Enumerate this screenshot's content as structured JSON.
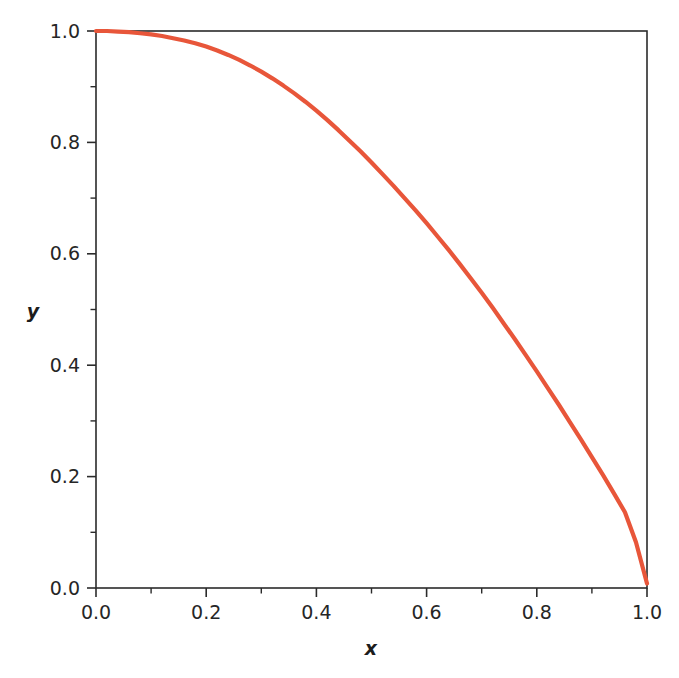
{
  "figure": {
    "background_color": "#ffffff",
    "frame_color": "#2b2b2b",
    "width": 679,
    "height": 678
  },
  "axes": {
    "x_title": "x",
    "y_title": "y",
    "x_tick_labels": [
      "0.0",
      "0.2",
      "0.4",
      "0.6",
      "0.8",
      "1.0"
    ],
    "y_tick_labels": [
      "0.0",
      "0.2",
      "0.4",
      "0.6",
      "0.8",
      "1.0"
    ]
  },
  "chart_data": {
    "type": "line",
    "title": "",
    "subtitle": "",
    "xlabel": "x",
    "ylabel": "y",
    "xlim": [
      0.0,
      1.0
    ],
    "ylim": [
      0.0,
      1.0
    ],
    "xticks": [
      0.0,
      0.2,
      0.4,
      0.6,
      0.8,
      1.0
    ],
    "yticks": [
      0.0,
      0.2,
      0.4,
      0.6,
      0.8,
      1.0
    ],
    "xtick_labels": [
      "0.0",
      "0.2",
      "0.4",
      "0.6",
      "0.8",
      "1.0"
    ],
    "ytick_labels": [
      "0.0",
      "0.2",
      "0.4",
      "0.6",
      "0.8",
      "1.0"
    ],
    "x_minor_tick_interval": 0.1,
    "y_minor_tick_interval": 0.1,
    "grid": false,
    "legend": null,
    "legend_position": "none",
    "annotations": [],
    "series": [
      {
        "name": "y(x)",
        "color": "#E8563A",
        "line_width": 4.2,
        "x": [
          0.0,
          0.02,
          0.04,
          0.06,
          0.08,
          0.1,
          0.12,
          0.14,
          0.16,
          0.18,
          0.2,
          0.22,
          0.24,
          0.26,
          0.28,
          0.3,
          0.32,
          0.34,
          0.36,
          0.38,
          0.4,
          0.42,
          0.44,
          0.46,
          0.48,
          0.5,
          0.52,
          0.54,
          0.56,
          0.58,
          0.6,
          0.62,
          0.64,
          0.66,
          0.68,
          0.7,
          0.72,
          0.74,
          0.76,
          0.78,
          0.8,
          0.82,
          0.84,
          0.86,
          0.88,
          0.9,
          0.92,
          0.94,
          0.96,
          0.98,
          1.0
        ],
        "y": [
          1.0,
          1.0,
          0.999,
          0.998,
          0.996,
          0.994,
          0.991,
          0.987,
          0.983,
          0.978,
          0.972,
          0.965,
          0.957,
          0.948,
          0.938,
          0.927,
          0.915,
          0.902,
          0.888,
          0.873,
          0.857,
          0.84,
          0.822,
          0.803,
          0.784,
          0.764,
          0.743,
          0.722,
          0.7,
          0.678,
          0.655,
          0.631,
          0.607,
          0.582,
          0.556,
          0.53,
          0.503,
          0.475,
          0.447,
          0.418,
          0.389,
          0.359,
          0.329,
          0.298,
          0.267,
          0.235,
          0.203,
          0.17,
          0.136,
          0.082,
          0.008
        ]
      }
    ]
  }
}
